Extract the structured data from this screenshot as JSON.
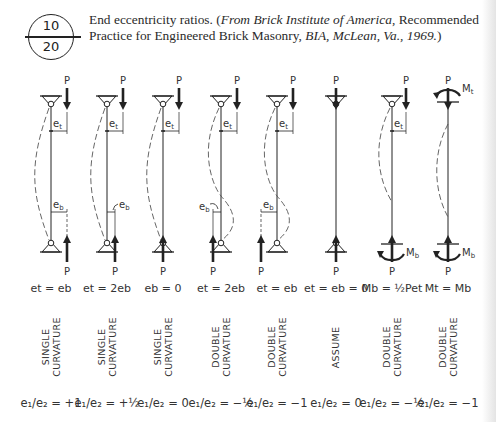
{
  "figure": {
    "badge": {
      "top": "10",
      "bottom": "20"
    },
    "caption": {
      "text_plain": "End eccentricity ratios. (",
      "source_italic": "From Brick Institute of America",
      "text_mid": ", Recommended Practice for Engineered Brick Masonry, ",
      "org_italic": "BIA, McLean, Va., 1969.",
      "text_end": ")"
    }
  },
  "labels": {
    "load": "P",
    "et": "e",
    "et_sub": "t",
    "eb": "e",
    "eb_sub": "b",
    "Mt": "M",
    "Mt_sub": "t",
    "Mb": "M",
    "Mb_sub": "b"
  },
  "columns": [
    {
      "x": 51,
      "top": "pin",
      "bottom": "pin",
      "top_load_offset": 16,
      "bottom_load_offset": 16,
      "curve": "single",
      "show_et": true,
      "show_eb": true,
      "eb_style": "dim",
      "condition": "eₜ = eᵦ",
      "condition_text": "et = eb",
      "curvature": [
        "SINGLE",
        "CURVATURE"
      ],
      "ratio": "e₁/e₂ = +1"
    },
    {
      "x": 107,
      "top": "pin",
      "bottom": "pin",
      "top_load_offset": 16,
      "bottom_load_offset": 8,
      "curve": "single",
      "show_et": true,
      "show_eb": true,
      "eb_style": "arc",
      "condition_text": "et = 2eb",
      "curvature": [
        "SINGLE",
        "CURVATURE"
      ],
      "ratio": "e₁/e₂ = +½"
    },
    {
      "x": 163,
      "top": "pin",
      "bottom": "pin",
      "top_load_offset": 16,
      "bottom_load_offset": 0,
      "curve": "single",
      "show_et": true,
      "show_eb": false,
      "eb_style": "none",
      "condition_text": "eb = 0",
      "curvature": [
        "SINGLE",
        "CURVATURE"
      ],
      "ratio": "e₁/e₂ = 0"
    },
    {
      "x": 221,
      "top": "pin",
      "bottom": "pin",
      "top_load_offset": 16,
      "bottom_load_offset": -8,
      "curve": "double",
      "show_et": true,
      "show_eb": true,
      "eb_style": "arc-left",
      "condition_text": "et = 2eb",
      "curvature": [
        "DOUBLE",
        "CURVATURE"
      ],
      "ratio": "e₁/e₂ = −½"
    },
    {
      "x": 277,
      "top": "pin",
      "bottom": "pin",
      "top_load_offset": 16,
      "bottom_load_offset": -16,
      "curve": "double",
      "show_et": true,
      "show_eb": true,
      "eb_style": "dim-left",
      "condition_text": "et = eb",
      "curvature": [
        "DOUBLE",
        "CURVATURE"
      ],
      "ratio": "e₁/e₂ = −1"
    },
    {
      "x": 336,
      "top": "pin",
      "bottom": "pin",
      "top_load_offset": 0,
      "bottom_load_offset": 0,
      "curve": "none",
      "show_et": false,
      "show_eb": false,
      "eb_style": "none",
      "condition_text": "et = eb = 0",
      "curvature": [
        "ASSUME"
      ],
      "ratio": "e₁/e₂ = 0"
    },
    {
      "x": 392,
      "top": "pin",
      "bottom": "fixed",
      "top_load_offset": 14,
      "bottom_load_offset": 0,
      "curve": "single-top",
      "show_et": true,
      "show_eb": false,
      "eb_style": "none",
      "condition_text": "Mb = ½Pet",
      "curvature": [
        "DOUBLE",
        "CURVATURE"
      ],
      "ratio": "e₁/e₂ = −½"
    },
    {
      "x": 448,
      "top": "fixed",
      "bottom": "fixed",
      "top_load_offset": 0,
      "bottom_load_offset": 0,
      "curve": "mid",
      "show_et": false,
      "show_eb": false,
      "eb_style": "none",
      "condition_text": "Mt = Mb",
      "curvature": [
        "DOUBLE",
        "CURVATURE"
      ],
      "ratio": "e₁/e₂ = −1"
    }
  ],
  "colors": {
    "ink": "#222222",
    "paper": "#ffffff",
    "dash": "#555555"
  }
}
